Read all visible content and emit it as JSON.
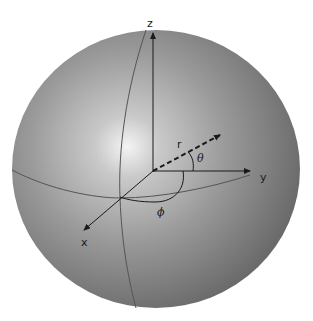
{
  "diagram": {
    "labels": {
      "z_axis": "z",
      "y_axis": "y",
      "x_axis": "x",
      "radius": "r",
      "polar_angle": "θ",
      "azimuth_angle": "ϕ"
    },
    "colors": {
      "sphere_highlight": "#f2f2f2",
      "sphere_mid": "#a8a8a8",
      "sphere_edge": "#6e6e6e",
      "lines": "#1a1a1a",
      "grid_curves": "#555555"
    }
  }
}
